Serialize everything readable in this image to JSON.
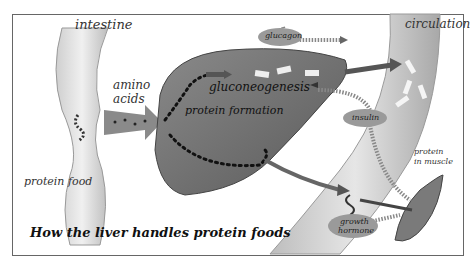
{
  "diagram": {
    "title": "How the liver handles protein foods",
    "labels": {
      "intestine": "intestine",
      "amino_acids_1": "amino",
      "amino_acids_2": "acids",
      "protein_food": "protein food",
      "glucagon": "glucagon",
      "gluconeogenesis": "gluconeogenesis",
      "protein_formation": "protein formation",
      "circulation": "circulation",
      "insulin": "insulin",
      "protein_in_muscle_1": "protein",
      "protein_in_muscle_2": "in muscle",
      "growth_hormone_1": "growth",
      "growth_hormone_2": "hormone"
    },
    "colors": {
      "liver": "#6e6e6e",
      "vessel": "#c8c8c8",
      "arrow": "#555555",
      "hormone_oval": "#9a9a9a"
    }
  }
}
